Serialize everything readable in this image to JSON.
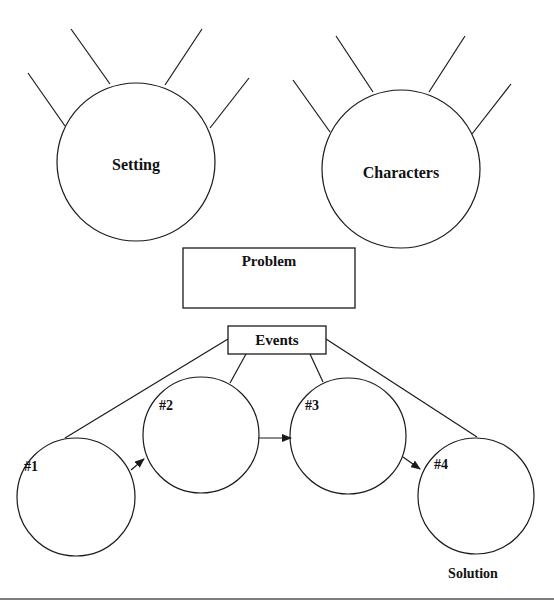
{
  "diagram": {
    "type": "story-map graphic organizer",
    "colors": {
      "stroke": "#1a1a1a",
      "text": "#111111",
      "background": "#ffffff"
    },
    "setting": {
      "label": "Setting",
      "spokes": 4
    },
    "characters": {
      "label": "Characters",
      "spokes": 4
    },
    "problem": {
      "label": "Problem"
    },
    "events": {
      "label": "Events",
      "items": [
        {
          "label": "#1"
        },
        {
          "label": "#2"
        },
        {
          "label": "#3"
        },
        {
          "label": "#4"
        }
      ]
    },
    "solution": {
      "label": "Solution"
    }
  }
}
